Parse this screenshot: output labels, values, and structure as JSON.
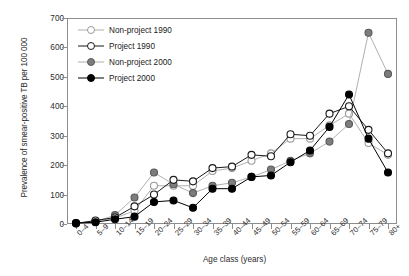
{
  "chart_data": {
    "type": "line",
    "title": "",
    "xlabel": "Age class (years)",
    "ylabel": "Prevalence of smear-positive TB per 100 000",
    "categories": [
      "0–4",
      "5–9",
      "10–14",
      "15–19",
      "20–24",
      "25–29",
      "30–34",
      "35–39",
      "40–44",
      "45–49",
      "50–54",
      "55–59",
      "60–64",
      "65–69",
      "70–74",
      "75–79",
      "80+"
    ],
    "ylim": [
      0,
      700
    ],
    "yticks": [
      0,
      100,
      200,
      300,
      400,
      500,
      600,
      700
    ],
    "ytick_labels": [
      "0",
      "100",
      "200",
      "300",
      "400",
      "500",
      "600",
      "700"
    ],
    "grid": false,
    "legend_position": "upper-left-inside",
    "series": [
      {
        "name": "Non-project 1990",
        "marker": "open-circle",
        "marker_fill": "#ffffff",
        "marker_edge": "#9a9a9a",
        "line_color": "#b0b0b0",
        "values": [
          2,
          10,
          20,
          45,
          130,
          130,
          130,
          180,
          190,
          215,
          240,
          290,
          290,
          335,
          375,
          275,
          235
        ]
      },
      {
        "name": "Project 1990",
        "marker": "open-circle",
        "marker_fill": "#ffffff",
        "marker_edge": "#1a1a1a",
        "line_color": "#1a1a1a",
        "values": [
          2,
          12,
          22,
          60,
          100,
          150,
          145,
          190,
          195,
          235,
          230,
          305,
          300,
          375,
          400,
          320,
          240
        ]
      },
      {
        "name": "Non-project 2000",
        "marker": "filled-circle",
        "marker_fill": "#7d7d7d",
        "marker_edge": "#5a5a5a",
        "line_color": "#b0b0b0",
        "values": [
          3,
          8,
          30,
          90,
          175,
          135,
          105,
          130,
          140,
          160,
          185,
          215,
          240,
          280,
          340,
          650,
          510
        ]
      },
      {
        "name": "Project 2000",
        "marker": "filled-circle",
        "marker_fill": "#000000",
        "marker_edge": "#000000",
        "line_color": "#000000",
        "values": [
          3,
          6,
          16,
          25,
          75,
          80,
          55,
          120,
          120,
          160,
          165,
          210,
          250,
          330,
          440,
          290,
          175
        ]
      }
    ]
  }
}
